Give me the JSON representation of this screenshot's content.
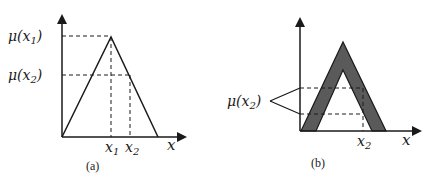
{
  "panel_a": {
    "caption": "(a)",
    "y_labels": {
      "mu_x1": "μ(x",
      "mu_x1_sub": "1",
      "mu_x2": "μ(x",
      "mu_x2_sub": "2",
      "close": ")"
    },
    "x_labels": {
      "x1": "x",
      "x1_sub": "1",
      "x2": "x",
      "x2_sub": "2",
      "axis": "x"
    },
    "shape": "triangular membership function"
  },
  "panel_b": {
    "caption": "(b)",
    "y_label": {
      "mu_x2": "μ(x",
      "mu_x2_sub": "2",
      "close": ")"
    },
    "x_labels": {
      "x2": "x",
      "x2_sub": "2",
      "axis": "x"
    },
    "shape": "interval type-2 triangular membership function (shaded footprint of uncertainty)",
    "fill_color": "#5a5a5a"
  },
  "colors": {
    "line": "#1a1a1a",
    "fou_fill": "#5a5a5a",
    "background": "#ffffff"
  }
}
